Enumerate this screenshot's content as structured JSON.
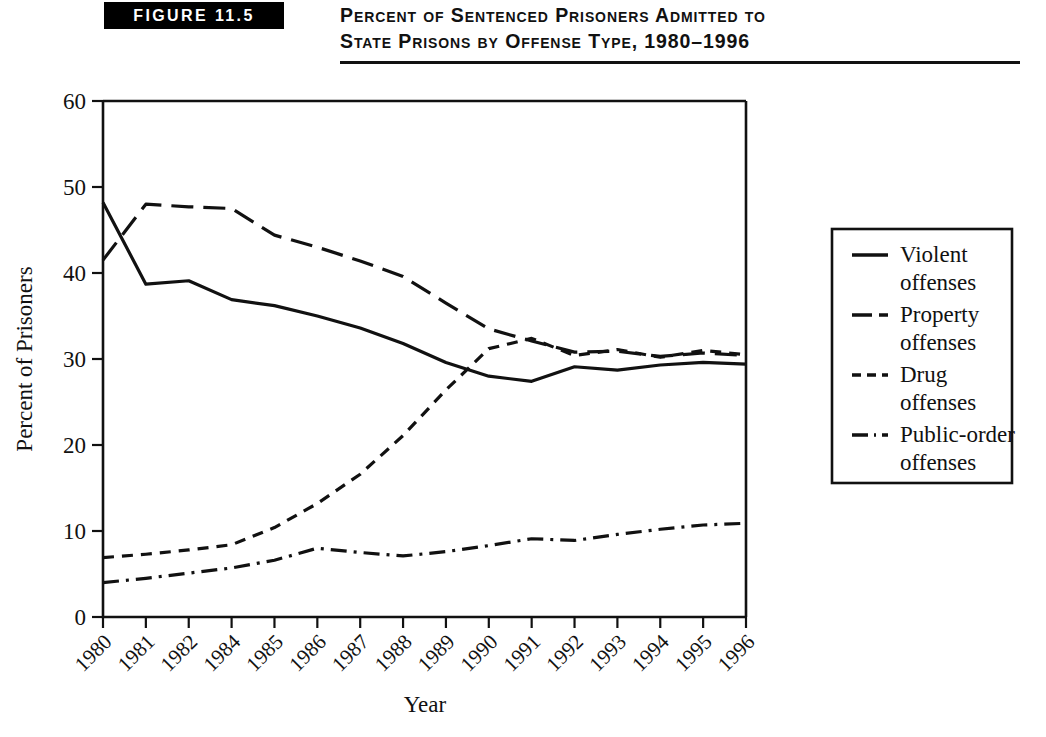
{
  "figure": {
    "badge_label": "FIGURE 11.5",
    "title_line1": "Percent of Sentenced Prisoners Admitted to",
    "title_line2": "State Prisons by Offense Type, 1980–1996"
  },
  "chart_data": {
    "type": "line",
    "title": "Percent of Sentenced Prisoners Admitted to State Prisons by Offense Type, 1980–1996",
    "xlabel": "Year",
    "ylabel": "Percent of Prisoners",
    "ylim": [
      0,
      60
    ],
    "yticks": [
      0,
      10,
      20,
      30,
      40,
      50,
      60
    ],
    "grid": false,
    "legend_position": "right",
    "categories": [
      "1980",
      "1981",
      "1982",
      "1984",
      "1985",
      "1986",
      "1987",
      "1988",
      "1989",
      "1990",
      "1991",
      "1992",
      "1993",
      "1994",
      "1995",
      "1996"
    ],
    "series": [
      {
        "name": "Violent offenses",
        "line_style": "solid",
        "values": [
          48.2,
          38.7,
          39.1,
          36.9,
          36.2,
          35.0,
          33.6,
          31.8,
          29.6,
          28.0,
          27.4,
          29.1,
          28.7,
          29.3,
          29.6,
          29.4
        ]
      },
      {
        "name": "Property offenses",
        "line_style": "long-dash",
        "values": [
          41.5,
          48.0,
          47.7,
          47.5,
          44.4,
          43.0,
          41.4,
          39.6,
          36.5,
          33.5,
          32.1,
          30.8,
          30.9,
          30.3,
          30.7,
          30.4
        ]
      },
      {
        "name": "Drug offenses",
        "line_style": "short-dash",
        "values": [
          6.9,
          7.3,
          7.8,
          8.4,
          10.4,
          13.2,
          16.6,
          21.1,
          26.4,
          31.2,
          32.4,
          30.4,
          31.1,
          30.2,
          31.0,
          30.5
        ]
      },
      {
        "name": "Public-order offenses",
        "line_style": "dash-dot",
        "values": [
          4.0,
          4.5,
          5.1,
          5.7,
          6.6,
          8.0,
          7.5,
          7.1,
          7.6,
          8.3,
          9.1,
          8.9,
          9.6,
          10.2,
          10.7,
          10.9
        ]
      }
    ]
  },
  "legend": {
    "entries": [
      {
        "line1": "Violent",
        "line2": "offenses",
        "style": "solid"
      },
      {
        "line1": "Property",
        "line2": "offenses",
        "style": "long-dash"
      },
      {
        "line1": "Drug",
        "line2": "offenses",
        "style": "short-dash"
      },
      {
        "line1": "Public-order",
        "line2": "offenses",
        "style": "dash-dot"
      }
    ]
  }
}
